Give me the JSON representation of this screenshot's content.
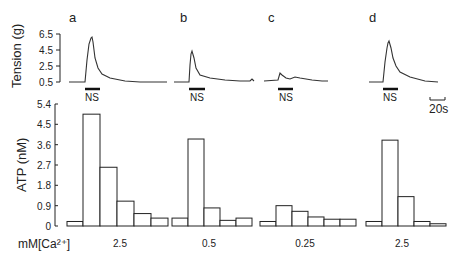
{
  "chart_data": [
    {
      "type": "line",
      "title": "",
      "ylabel": "Tension (g)",
      "yticks": [
        "6.5",
        "4.5",
        "2.5",
        "0.5"
      ],
      "ylim": [
        0.5,
        6.5
      ],
      "panels": [
        "a",
        "b",
        "c",
        "d"
      ],
      "stimulus_label": "NS",
      "scale_bar_label": "20s",
      "peak_tension": [
        6.0,
        4.3,
        1.6,
        5.4
      ]
    },
    {
      "type": "bar",
      "ylabel": "ATP (nM)",
      "yticks": [
        "5.4",
        "4.5",
        "3.6",
        "2.7",
        "1.8",
        "0.9",
        "0"
      ],
      "ylim": [
        0,
        5.4
      ],
      "xlabel": "mM[Ca²⁺]",
      "groups": [
        {
          "panel": "a",
          "ca": "2.5",
          "values": [
            0.2,
            4.95,
            2.6,
            1.1,
            0.55,
            0.35
          ]
        },
        {
          "panel": "b",
          "ca": "0.5",
          "values": [
            0.35,
            3.85,
            0.8,
            0.25,
            0.35
          ]
        },
        {
          "panel": "c",
          "ca": "0.25",
          "values": [
            0.2,
            0.9,
            0.65,
            0.4,
            0.3,
            0.3
          ]
        },
        {
          "panel": "d",
          "ca": "2.5",
          "values": [
            0.2,
            3.8,
            1.3,
            0.2,
            0.1
          ]
        }
      ]
    }
  ],
  "labels": {
    "panel_a": "a",
    "panel_b": "b",
    "panel_c": "c",
    "panel_d": "d",
    "tension_axis": "Tension (g)",
    "atp_axis": "ATP (nM)",
    "ca_label": "mM[Ca²⁺]",
    "ns": "NS",
    "scale": "20s",
    "ca_a": "2.5",
    "ca_b": "0.5",
    "ca_c": "0.25",
    "ca_d": "2.5",
    "t_tick_0": "6.5",
    "t_tick_1": "4.5",
    "t_tick_2": "2.5",
    "t_tick_3": "0.5",
    "b_tick_0": "5.4",
    "b_tick_1": "4.5",
    "b_tick_2": "3.6",
    "b_tick_3": "2.7",
    "b_tick_4": "1.8",
    "b_tick_5": "0.9",
    "b_tick_6": "0"
  }
}
